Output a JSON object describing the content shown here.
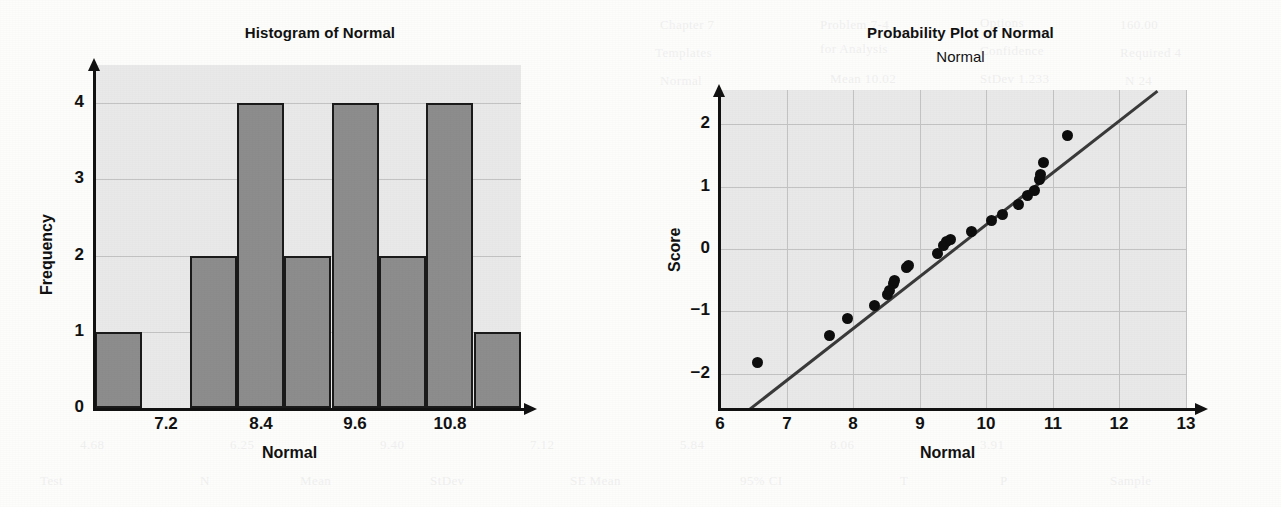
{
  "histogram": {
    "title": "Histogram of Normal",
    "xlabel": "Normal",
    "ylabel": "Frequency",
    "ytick_labels": [
      "0",
      "1",
      "2",
      "3",
      "4"
    ],
    "xtick_labels": [
      "7.2",
      "8.4",
      "9.6",
      "10.8"
    ]
  },
  "probplot": {
    "title": "Probability Plot of Normal",
    "subtitle": "Normal",
    "xlabel": "Normal",
    "ylabel": "Score",
    "ytick_labels": [
      "−2",
      "−1",
      "0",
      "1",
      "2"
    ],
    "xtick_labels": [
      "6",
      "7",
      "8",
      "9",
      "10",
      "11",
      "12",
      "13"
    ]
  },
  "colors": {
    "plot_background": "#e9e9e9",
    "bar_fill": "#8d8d8d",
    "bar_border": "#1a1a1a",
    "gridline": "#c3c3c3",
    "axis": "#111111",
    "marker": "#0d0d0d",
    "fit_line": "#3a3a3a",
    "page_background": "#fdfdfc"
  },
  "bleed_text": [
    {
      "t": "Chapter 7",
      "x": 660,
      "y": 10
    },
    {
      "t": "Problem 7-4",
      "x": 820,
      "y": 10
    },
    {
      "t": "Options",
      "x": 980,
      "y": 8
    },
    {
      "t": "160.00",
      "x": 1120,
      "y": 10
    },
    {
      "t": "Templates",
      "x": 655,
      "y": 38
    },
    {
      "t": "for Analysis",
      "x": 820,
      "y": 34
    },
    {
      "t": "Confidence",
      "x": 980,
      "y": 36
    },
    {
      "t": "Required 4",
      "x": 1120,
      "y": 38
    },
    {
      "t": "Normal",
      "x": 660,
      "y": 66
    },
    {
      "t": "Mean  10.02",
      "x": 830,
      "y": 64
    },
    {
      "t": "StDev 1.233",
      "x": 980,
      "y": 64
    },
    {
      "t": "N     24",
      "x": 1125,
      "y": 66
    },
    {
      "t": "the estimate and t",
      "x": 200,
      "y": 150
    },
    {
      "t": "interval for the me",
      "x": 200,
      "y": 182
    },
    {
      "t": "sample statistics a",
      "x": 200,
      "y": 214
    },
    {
      "t": "normally distribut",
      "x": 200,
      "y": 246
    },
    {
      "t": "a probability plot",
      "x": 200,
      "y": 278
    },
    {
      "t": "the observations fa",
      "x": 200,
      "y": 310
    },
    {
      "t": "reasonably close t",
      "x": 200,
      "y": 342
    },
    {
      "t": "Exercise 7.2",
      "x": 205,
      "y": 378
    },
    {
      "t": "4.68",
      "x": 80,
      "y": 430
    },
    {
      "t": "6.25",
      "x": 230,
      "y": 430
    },
    {
      "t": "9.40",
      "x": 380,
      "y": 430
    },
    {
      "t": "7.12",
      "x": 530,
      "y": 430
    },
    {
      "t": "5.84",
      "x": 680,
      "y": 430
    },
    {
      "t": "8.06",
      "x": 830,
      "y": 430
    },
    {
      "t": "3.91",
      "x": 980,
      "y": 430
    },
    {
      "t": "Test",
      "x": 40,
      "y": 466
    },
    {
      "t": "N",
      "x": 200,
      "y": 466
    },
    {
      "t": "Mean",
      "x": 300,
      "y": 466
    },
    {
      "t": "StDev",
      "x": 430,
      "y": 466
    },
    {
      "t": "SE Mean",
      "x": 570,
      "y": 466
    },
    {
      "t": "95% CI",
      "x": 740,
      "y": 466
    },
    {
      "t": "T",
      "x": 900,
      "y": 466
    },
    {
      "t": "P",
      "x": 1000,
      "y": 466
    },
    {
      "t": "Sample",
      "x": 1110,
      "y": 466
    }
  ],
  "chart_data": [
    {
      "type": "bar",
      "title": "Histogram of Normal",
      "xlabel": "Normal",
      "ylabel": "Frequency",
      "categories": [
        "6.6",
        "7.2",
        "7.8",
        "8.4",
        "9.0",
        "9.6",
        "10.2",
        "10.8",
        "11.4"
      ],
      "bin_edges": [
        6.3,
        6.9,
        7.5,
        8.1,
        8.7,
        9.3,
        9.9,
        10.5,
        11.1,
        11.7
      ],
      "values": [
        1,
        0,
        2,
        4,
        2,
        4,
        2,
        4,
        1
      ],
      "xlim": [
        6.3,
        11.7
      ],
      "ylim": [
        0,
        4.5
      ],
      "xticks": [
        7.2,
        8.4,
        9.6,
        10.8
      ],
      "yticks": [
        0,
        1,
        2,
        3,
        4
      ],
      "grid": true,
      "legend": "none"
    },
    {
      "type": "scatter",
      "title": "Probability Plot of Normal",
      "subtitle": "Normal",
      "xlabel": "Normal",
      "ylabel": "Score",
      "xlim": [
        6,
        13
      ],
      "ylim": [
        -2.55,
        2.55
      ],
      "xticks": [
        6,
        7,
        8,
        9,
        10,
        11,
        12,
        13
      ],
      "yticks": [
        -2,
        -1,
        0,
        1,
        2
      ],
      "grid": true,
      "legend": "none",
      "points": [
        {
          "x": 6.57,
          "y": -1.82
        },
        {
          "x": 7.65,
          "y": -1.38
        },
        {
          "x": 7.92,
          "y": -1.12
        },
        {
          "x": 8.32,
          "y": -0.9
        },
        {
          "x": 8.52,
          "y": -0.73
        },
        {
          "x": 8.55,
          "y": -0.66
        },
        {
          "x": 8.6,
          "y": -0.55
        },
        {
          "x": 8.62,
          "y": -0.5
        },
        {
          "x": 8.8,
          "y": -0.3
        },
        {
          "x": 8.83,
          "y": -0.26
        },
        {
          "x": 9.26,
          "y": -0.07
        },
        {
          "x": 9.36,
          "y": 0.06
        },
        {
          "x": 9.4,
          "y": 0.12
        },
        {
          "x": 9.46,
          "y": 0.16
        },
        {
          "x": 9.78,
          "y": 0.28
        },
        {
          "x": 10.08,
          "y": 0.45
        },
        {
          "x": 10.25,
          "y": 0.56
        },
        {
          "x": 10.48,
          "y": 0.72
        },
        {
          "x": 10.62,
          "y": 0.86
        },
        {
          "x": 10.73,
          "y": 0.94
        },
        {
          "x": 10.8,
          "y": 1.12
        },
        {
          "x": 10.82,
          "y": 1.2
        },
        {
          "x": 10.86,
          "y": 1.38
        },
        {
          "x": 11.22,
          "y": 1.82
        }
      ],
      "fit_line": {
        "x0": 6.43,
        "y0": -2.55,
        "x1": 12.55,
        "y1": 2.55
      }
    }
  ]
}
